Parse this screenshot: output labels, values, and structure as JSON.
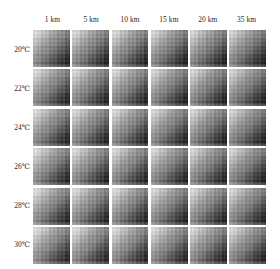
{
  "figure": {
    "background_color": "#ffffff",
    "text_color": "#1f1f1f"
  },
  "columns": [
    {
      "label": "1 km"
    },
    {
      "label": "5 km"
    },
    {
      "label": "10 km"
    },
    {
      "label": "15 km"
    },
    {
      "label": "20 km"
    },
    {
      "label": "35 km"
    }
  ],
  "rows": [
    {
      "label": "20℃"
    },
    {
      "label": "22℃"
    },
    {
      "label": "24℃"
    },
    {
      "label": "26℃"
    },
    {
      "label": "28℃"
    },
    {
      "label": "30℃"
    }
  ],
  "chart_data": {
    "type": "heatmap",
    "title": "",
    "subtitle": "",
    "xlabel": "",
    "ylabel": "",
    "legend": [],
    "grid": false,
    "colormap": "grayscale",
    "colormap_low": "#f2f2f2",
    "colormap_high": "#101010",
    "panel_layout": {
      "rows": 6,
      "cols": 6
    },
    "panel_col_labels": [
      "1 km",
      "5 km",
      "10 km",
      "15 km",
      "20 km",
      "35 km"
    ],
    "panel_row_labels": [
      "20℃",
      "22℃",
      "24℃",
      "26℃",
      "28℃",
      "30℃"
    ],
    "panel_description": "Each panel is a grayscale intensity map, bright at the top-left corner and darkening diagonally toward the bottom-right corner, with blocky pixel-level noise.",
    "panel_corner_values": {
      "top_left": 0.06,
      "top_right": 0.55,
      "bottom_left": 0.48,
      "bottom_right": 0.95
    },
    "value_range": [
      0,
      1
    ],
    "panels": [
      {
        "row": "20℃",
        "col": "1 km",
        "top_left": 0.06,
        "top_right": 0.55,
        "bottom_left": 0.48,
        "bottom_right": 0.95
      },
      {
        "row": "20℃",
        "col": "5 km",
        "top_left": 0.07,
        "top_right": 0.56,
        "bottom_left": 0.49,
        "bottom_right": 0.95
      },
      {
        "row": "20℃",
        "col": "10 km",
        "top_left": 0.07,
        "top_right": 0.56,
        "bottom_left": 0.49,
        "bottom_right": 0.95
      },
      {
        "row": "20℃",
        "col": "15 km",
        "top_left": 0.08,
        "top_right": 0.57,
        "bottom_left": 0.5,
        "bottom_right": 0.96
      },
      {
        "row": "20℃",
        "col": "20 km",
        "top_left": 0.08,
        "top_right": 0.57,
        "bottom_left": 0.5,
        "bottom_right": 0.96
      },
      {
        "row": "20℃",
        "col": "35 km",
        "top_left": 0.09,
        "top_right": 0.58,
        "bottom_left": 0.51,
        "bottom_right": 0.96
      },
      {
        "row": "22℃",
        "col": "1 km",
        "top_left": 0.06,
        "top_right": 0.55,
        "bottom_left": 0.48,
        "bottom_right": 0.95
      },
      {
        "row": "22℃",
        "col": "5 km",
        "top_left": 0.07,
        "top_right": 0.55,
        "bottom_left": 0.48,
        "bottom_right": 0.95
      },
      {
        "row": "22℃",
        "col": "10 km",
        "top_left": 0.07,
        "top_right": 0.56,
        "bottom_left": 0.49,
        "bottom_right": 0.95
      },
      {
        "row": "22℃",
        "col": "15 km",
        "top_left": 0.08,
        "top_right": 0.56,
        "bottom_left": 0.49,
        "bottom_right": 0.96
      },
      {
        "row": "22℃",
        "col": "20 km",
        "top_left": 0.08,
        "top_right": 0.57,
        "bottom_left": 0.5,
        "bottom_right": 0.96
      },
      {
        "row": "22℃",
        "col": "35 km",
        "top_left": 0.09,
        "top_right": 0.57,
        "bottom_left": 0.5,
        "bottom_right": 0.96
      },
      {
        "row": "24℃",
        "col": "1 km",
        "top_left": 0.06,
        "top_right": 0.54,
        "bottom_left": 0.47,
        "bottom_right": 0.95
      },
      {
        "row": "24℃",
        "col": "5 km",
        "top_left": 0.07,
        "top_right": 0.55,
        "bottom_left": 0.48,
        "bottom_right": 0.95
      },
      {
        "row": "24℃",
        "col": "10 km",
        "top_left": 0.07,
        "top_right": 0.55,
        "bottom_left": 0.48,
        "bottom_right": 0.95
      },
      {
        "row": "24℃",
        "col": "15 km",
        "top_left": 0.08,
        "top_right": 0.56,
        "bottom_left": 0.49,
        "bottom_right": 0.95
      },
      {
        "row": "24℃",
        "col": "20 km",
        "top_left": 0.08,
        "top_right": 0.56,
        "bottom_left": 0.49,
        "bottom_right": 0.96
      },
      {
        "row": "24℃",
        "col": "35 km",
        "top_left": 0.09,
        "top_right": 0.57,
        "bottom_left": 0.5,
        "bottom_right": 0.96
      },
      {
        "row": "26℃",
        "col": "1 km",
        "top_left": 0.05,
        "top_right": 0.54,
        "bottom_left": 0.47,
        "bottom_right": 0.94
      },
      {
        "row": "26℃",
        "col": "5 km",
        "top_left": 0.06,
        "top_right": 0.54,
        "bottom_left": 0.47,
        "bottom_right": 0.95
      },
      {
        "row": "26℃",
        "col": "10 km",
        "top_left": 0.07,
        "top_right": 0.55,
        "bottom_left": 0.48,
        "bottom_right": 0.95
      },
      {
        "row": "26℃",
        "col": "15 km",
        "top_left": 0.07,
        "top_right": 0.55,
        "bottom_left": 0.48,
        "bottom_right": 0.95
      },
      {
        "row": "26℃",
        "col": "20 km",
        "top_left": 0.08,
        "top_right": 0.56,
        "bottom_left": 0.49,
        "bottom_right": 0.95
      },
      {
        "row": "26℃",
        "col": "35 km",
        "top_left": 0.08,
        "top_right": 0.56,
        "bottom_left": 0.49,
        "bottom_right": 0.96
      },
      {
        "row": "28℃",
        "col": "1 km",
        "top_left": 0.05,
        "top_right": 0.53,
        "bottom_left": 0.46,
        "bottom_right": 0.94
      },
      {
        "row": "28℃",
        "col": "5 km",
        "top_left": 0.06,
        "top_right": 0.54,
        "bottom_left": 0.47,
        "bottom_right": 0.94
      },
      {
        "row": "28℃",
        "col": "10 km",
        "top_left": 0.06,
        "top_right": 0.54,
        "bottom_left": 0.47,
        "bottom_right": 0.95
      },
      {
        "row": "28℃",
        "col": "15 km",
        "top_left": 0.07,
        "top_right": 0.55,
        "bottom_left": 0.48,
        "bottom_right": 0.95
      },
      {
        "row": "28℃",
        "col": "20 km",
        "top_left": 0.07,
        "top_right": 0.55,
        "bottom_left": 0.48,
        "bottom_right": 0.95
      },
      {
        "row": "28℃",
        "col": "35 km",
        "top_left": 0.08,
        "top_right": 0.56,
        "bottom_left": 0.49,
        "bottom_right": 0.95
      },
      {
        "row": "30℃",
        "col": "1 km",
        "top_left": 0.05,
        "top_right": 0.52,
        "bottom_left": 0.45,
        "bottom_right": 0.93
      },
      {
        "row": "30℃",
        "col": "5 km",
        "top_left": 0.05,
        "top_right": 0.53,
        "bottom_left": 0.46,
        "bottom_right": 0.94
      },
      {
        "row": "30℃",
        "col": "10 km",
        "top_left": 0.06,
        "top_right": 0.53,
        "bottom_left": 0.46,
        "bottom_right": 0.94
      },
      {
        "row": "30℃",
        "col": "15 km",
        "top_left": 0.06,
        "top_right": 0.54,
        "bottom_left": 0.47,
        "bottom_right": 0.94
      },
      {
        "row": "30℃",
        "col": "20 km",
        "top_left": 0.07,
        "top_right": 0.54,
        "bottom_left": 0.47,
        "bottom_right": 0.95
      },
      {
        "row": "30℃",
        "col": "35 km",
        "top_left": 0.07,
        "top_right": 0.55,
        "bottom_left": 0.48,
        "bottom_right": 0.95
      }
    ]
  }
}
